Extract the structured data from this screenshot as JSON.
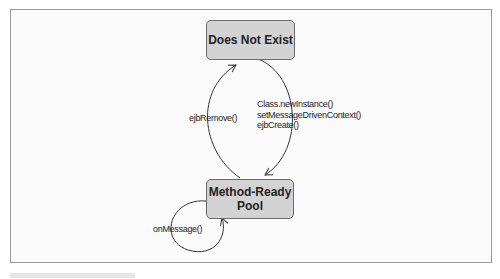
{
  "diagram": {
    "type": "state-diagram",
    "states": [
      {
        "id": "does-not-exist",
        "label": "Does Not Exist"
      },
      {
        "id": "method-ready-pool",
        "label_line1": "Method-Ready",
        "label_line2": "Pool"
      }
    ],
    "transitions": [
      {
        "from": "method-ready-pool",
        "to": "does-not-exist",
        "label": "ejbRemove()"
      },
      {
        "from": "does-not-exist",
        "to": "method-ready-pool",
        "labels": [
          "Class.newInstance()",
          "setMessageDrivenContext()",
          "ejbCreate()"
        ]
      },
      {
        "from": "method-ready-pool",
        "to": "method-ready-pool",
        "label": "onMessage()"
      }
    ],
    "colors": {
      "state_fill": "#d3d3d3",
      "state_border": "#6a6a6a",
      "line": "#333333"
    }
  }
}
